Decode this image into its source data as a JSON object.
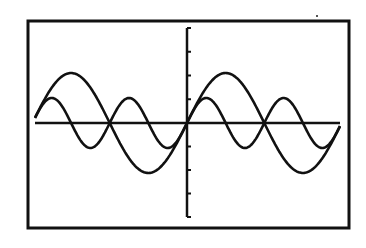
{
  "chart_data": {
    "type": "line",
    "title": "",
    "xlabel": "",
    "ylabel": "",
    "style": "graphing-calculator screen, black pixel plot on white",
    "grid": false,
    "legend": null,
    "frame": {
      "x0": 28,
      "y0": 21,
      "x1": 349,
      "y1": 228,
      "stroke": "#111111",
      "width": 3
    },
    "axes": {
      "origin_px": [
        187,
        123
      ],
      "x_axis": {
        "from_px": 35,
        "to_px": 340
      },
      "y_axis": {
        "from_px": 28,
        "to_px": 217,
        "tick_count_above": 4,
        "tick_count_below": 4
      },
      "color": "#111111"
    },
    "xlim": [
      -6.28,
      6.28
    ],
    "ylim": [
      -2,
      2
    ],
    "x_px_per_unit": 24.6,
    "y_px_per_unit": 50,
    "series": [
      {
        "name": "y = sin(x)",
        "amplitude": 1,
        "frequency": 1,
        "description": "larger wave, one full period on each side of the origin",
        "peaks_x": [
          -4.71,
          1.57
        ],
        "troughs_x": [
          -1.57,
          4.71
        ],
        "color": "#111111"
      },
      {
        "name": "y = 0.5 sin(2x)",
        "amplitude": 0.5,
        "frequency": 2,
        "description": "smaller wave, half the amplitude and twice the frequency",
        "peaks_x": [
          -5.5,
          -2.36,
          0.79,
          3.93
        ],
        "troughs_x": [
          -3.93,
          -0.79,
          2.36,
          5.5
        ],
        "color": "#111111"
      }
    ],
    "x_plot_range_px": [
      35,
      340
    ]
  }
}
